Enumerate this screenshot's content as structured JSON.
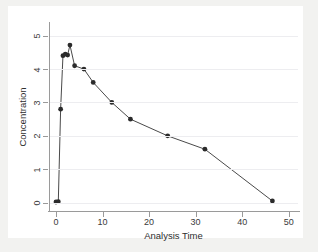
{
  "chart_data": {
    "type": "line",
    "title": "",
    "xlabel": "Analysis Time",
    "ylabel": "Concentration",
    "xlim": [
      -1.5,
      52
    ],
    "ylim": [
      -0.22,
      5.35
    ],
    "xticks": [
      0,
      10,
      20,
      30,
      40,
      50
    ],
    "yticks": [
      0,
      1,
      2,
      3,
      4,
      5
    ],
    "xticklabels": [
      "0",
      "10",
      "20",
      "30",
      "40",
      "50"
    ],
    "yticklabels": [
      "0",
      "1",
      "2",
      "3",
      "4",
      "5"
    ],
    "grid": "horizontal",
    "legend": "none",
    "marker": "filled-circle",
    "marker_color": "#2b2b2b",
    "line_color": "#4a4a4a",
    "series": [
      {
        "name": "Concentration vs Analysis Time",
        "x": [
          0,
          0.5,
          1,
          1.5,
          2,
          2.5,
          3,
          4,
          6,
          8,
          12,
          16,
          24,
          32,
          46.5
        ],
        "y": [
          0.02,
          0.03,
          2.8,
          4.4,
          4.45,
          4.42,
          4.72,
          4.1,
          4.0,
          3.6,
          3.0,
          2.5,
          2.0,
          1.6,
          0.05
        ]
      }
    ]
  },
  "axes": {
    "x_title": "Analysis Time",
    "y_title": "Concentration"
  },
  "colors": {
    "figure_background": "#f2f2f0",
    "plot_background": "#ffffff",
    "axis": "#9a9a9a",
    "gridline": "#ededf0",
    "marker": "#2b2b2b",
    "line": "#4a4a4a",
    "tick_text": "#3a3a3a",
    "axis_title": "#2e2e2e"
  }
}
